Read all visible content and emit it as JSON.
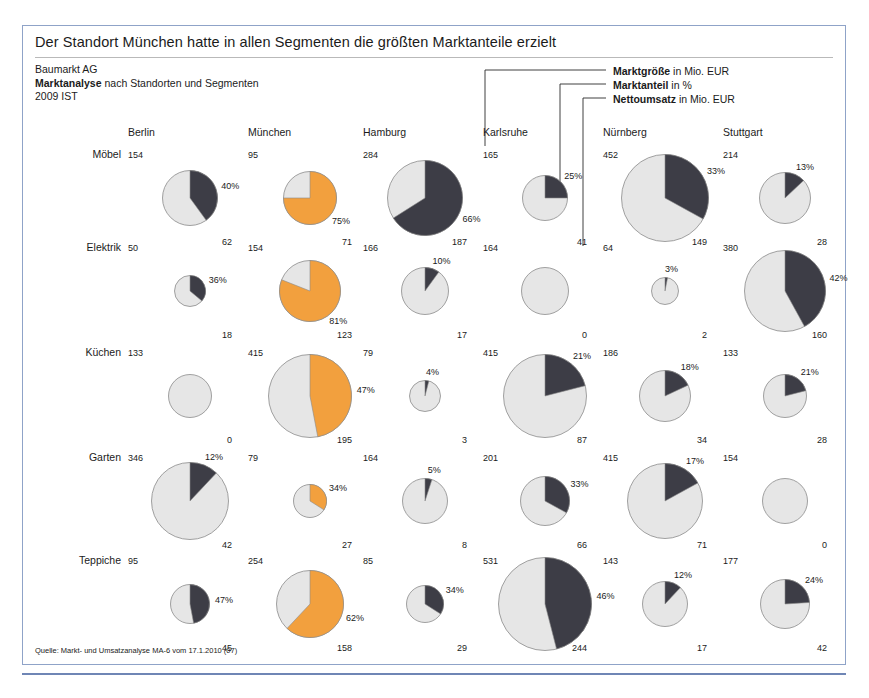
{
  "title": "Der Standort München hatte in allen Segmenten die größten Marktanteile erzielt",
  "subtitle": {
    "line1": "Baumarkt AG",
    "line2_bold": "Marktanalyse",
    "line2_rest": " nach Standorten und Segmenten",
    "line3": "2009 IST"
  },
  "legend": [
    {
      "bold": "Marktgröße",
      "rest": " in Mio. EUR"
    },
    {
      "bold": "Marktanteil",
      "rest": " in %"
    },
    {
      "bold": "Nettoumsatz",
      "rest": " in Mio. EUR"
    }
  ],
  "source": "Quelle: Markt- und Umsatzanalyse MA-6 vom 17.1.2010 (07)",
  "colors": {
    "highlight": "#f2a03e",
    "dark": "#3d3d46",
    "remainder": "#e6e6e6",
    "stroke": "#8a8a8a",
    "frame": "#8fa3c8",
    "rule": "#6f86b5"
  },
  "chart_data": {
    "type": "pie",
    "title": "Der Standort München hatte in allen Segmenten die größten Marktanteile erzielt",
    "subtitle": "Baumarkt AG — Marktanalyse nach Standorten und Segmenten — 2009 IST",
    "columns": [
      "Berlin",
      "München",
      "Hamburg",
      "Karlsruhe",
      "Nürnberg",
      "Stuttgart"
    ],
    "rows": [
      "Möbel",
      "Elektrik",
      "Küchen",
      "Garten",
      "Teppiche"
    ],
    "metrics": {
      "marktgroesse": "Marktgröße in Mio. EUR",
      "marktanteil": "Marktanteil in %",
      "nettoumsatz": "Nettoumsatz in Mio. EUR"
    },
    "highlight_column": "München",
    "cells": [
      [
        {
          "marktgroesse": 154,
          "marktanteil": 40,
          "pct_label": "40%",
          "nettoumsatz": 62,
          "r": 28,
          "hl": false
        },
        {
          "marktgroesse": 95,
          "marktanteil": 75,
          "pct_label": "75%",
          "nettoumsatz": 71,
          "r": 27,
          "hl": true
        },
        {
          "marktgroesse": 284,
          "marktanteil": 66,
          "pct_label": "66%",
          "nettoumsatz": 187,
          "r": 38,
          "hl": false
        },
        {
          "marktgroesse": 165,
          "marktanteil": 25,
          "pct_label": "25%",
          "nettoumsatz": 41,
          "r": 23,
          "hl": false
        },
        {
          "marktgroesse": 452,
          "marktanteil": 33,
          "pct_label": "33%",
          "nettoumsatz": 149,
          "r": 44,
          "hl": false
        },
        {
          "marktgroesse": 214,
          "marktanteil": 13,
          "pct_label": "13%",
          "nettoumsatz": 28,
          "r": 26,
          "hl": false
        }
      ],
      [
        {
          "marktgroesse": 50,
          "marktanteil": 36,
          "pct_label": "36%",
          "nettoumsatz": 18,
          "r": 16,
          "hl": false
        },
        {
          "marktgroesse": 154,
          "marktanteil": 81,
          "pct_label": "81%",
          "nettoumsatz": 123,
          "r": 31,
          "hl": true
        },
        {
          "marktgroesse": 166,
          "marktanteil": 10,
          "pct_label": "10%",
          "nettoumsatz": 17,
          "r": 24,
          "hl": false
        },
        {
          "marktgroesse": 164,
          "marktanteil": 0,
          "pct_label": "",
          "nettoumsatz": 0,
          "r": 24,
          "hl": false
        },
        {
          "marktgroesse": 64,
          "marktanteil": 3,
          "pct_label": "3%",
          "nettoumsatz": 2,
          "r": 14,
          "hl": false
        },
        {
          "marktgroesse": 380,
          "marktanteil": 42,
          "pct_label": "42%",
          "nettoumsatz": 160,
          "r": 41,
          "hl": false
        }
      ],
      [
        {
          "marktgroesse": 133,
          "marktanteil": 0,
          "pct_label": "",
          "nettoumsatz": 0,
          "r": 22,
          "hl": false
        },
        {
          "marktgroesse": 415,
          "marktanteil": 47,
          "pct_label": "47%",
          "nettoumsatz": 195,
          "r": 42,
          "hl": true
        },
        {
          "marktgroesse": 79,
          "marktanteil": 4,
          "pct_label": "4%",
          "nettoumsatz": 3,
          "r": 16,
          "hl": false
        },
        {
          "marktgroesse": 415,
          "marktanteil": 21,
          "pct_label": "21%",
          "nettoumsatz": 87,
          "r": 42,
          "hl": false
        },
        {
          "marktgroesse": 186,
          "marktanteil": 18,
          "pct_label": "18%",
          "nettoumsatz": 34,
          "r": 26,
          "hl": false
        },
        {
          "marktgroesse": 133,
          "marktanteil": 21,
          "pct_label": "21%",
          "nettoumsatz": 28,
          "r": 22,
          "hl": false
        }
      ],
      [
        {
          "marktgroesse": 346,
          "marktanteil": 12,
          "pct_label": "12%",
          "nettoumsatz": 42,
          "r": 39,
          "hl": false
        },
        {
          "marktgroesse": 79,
          "marktanteil": 34,
          "pct_label": "34%",
          "nettoumsatz": 27,
          "r": 17,
          "hl": true
        },
        {
          "marktgroesse": 164,
          "marktanteil": 5,
          "pct_label": "5%",
          "nettoumsatz": 8,
          "r": 23,
          "hl": false
        },
        {
          "marktgroesse": 201,
          "marktanteil": 33,
          "pct_label": "33%",
          "nettoumsatz": 66,
          "r": 25,
          "hl": false
        },
        {
          "marktgroesse": 415,
          "marktanteil": 17,
          "pct_label": "17%",
          "nettoumsatz": 71,
          "r": 38,
          "hl": false
        },
        {
          "marktgroesse": 154,
          "marktanteil": 0,
          "pct_label": "",
          "nettoumsatz": 0,
          "r": 23,
          "hl": false
        }
      ],
      [
        {
          "marktgroesse": 95,
          "marktanteil": 47,
          "pct_label": "47%",
          "nettoumsatz": 45,
          "r": 20,
          "hl": false
        },
        {
          "marktgroesse": 254,
          "marktanteil": 62,
          "pct_label": "62%",
          "nettoumsatz": 158,
          "r": 34,
          "hl": true
        },
        {
          "marktgroesse": 85,
          "marktanteil": 34,
          "pct_label": "34%",
          "nettoumsatz": 29,
          "r": 19,
          "hl": false
        },
        {
          "marktgroesse": 531,
          "marktanteil": 46,
          "pct_label": "46%",
          "nettoumsatz": 244,
          "r": 47,
          "hl": false
        },
        {
          "marktgroesse": 143,
          "marktanteil": 12,
          "pct_label": "12%",
          "nettoumsatz": 17,
          "r": 23,
          "hl": false
        },
        {
          "marktgroesse": 177,
          "marktanteil": 24,
          "pct_label": "24%",
          "nettoumsatz": 42,
          "r": 25,
          "hl": false
        }
      ]
    ],
    "callout_target": {
      "column": "Karlsruhe",
      "row": "Möbel"
    }
  }
}
